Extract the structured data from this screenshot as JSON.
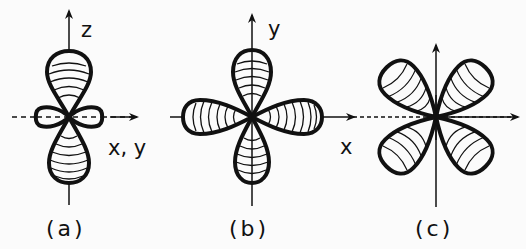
{
  "figure": {
    "panels": [
      {
        "id": "a",
        "caption": "(a)",
        "axis_labels": {
          "vertical": "z",
          "horizontal": "x, y"
        },
        "description": "dz2 orbital: two large lobes along z with a small torus (ring) in the xy plane"
      },
      {
        "id": "b",
        "caption": "(b)",
        "axis_labels": {
          "vertical": "y",
          "horizontal": "x"
        },
        "description": "four-lobed orbital with lobes along the x and y axes"
      },
      {
        "id": "c",
        "caption": "(c)",
        "axis_labels": {
          "vertical": "",
          "horizontal": ""
        },
        "description": "four-lobed orbital with lobes between the axes (diagonal)"
      }
    ],
    "colors": {
      "ink": "#111111",
      "background": "#fbfbfb"
    }
  }
}
